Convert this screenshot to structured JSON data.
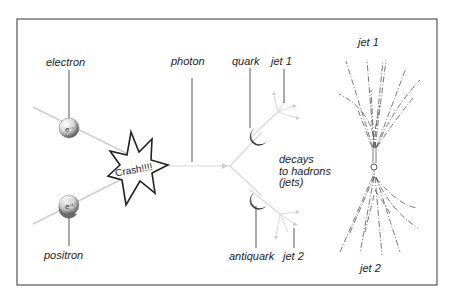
{
  "diagram": {
    "title": "",
    "frame": {
      "x": 17,
      "y": 19,
      "width": 420,
      "height": 266,
      "stroke": "#555555"
    },
    "labels": {
      "electron": "electron",
      "positron": "positron",
      "photon": "photon",
      "quark": "quark",
      "antiquark": "antiquark",
      "jet1_left": "jet 1",
      "jet2_left": "jet 2",
      "decays": "decays\nto hadrons\n(jets)",
      "jet1_right": "jet 1",
      "jet2_right": "jet 2",
      "crash": "Crash!!!!"
    },
    "particles": {
      "electron_symbol": "e⁻",
      "positron_symbol": "e⁺"
    },
    "colors": {
      "text": "#222222",
      "pointer": "#444444",
      "beam": "#cfcfcf",
      "star_stroke": "#222222",
      "track": "#555555"
    },
    "stages": [
      "electron-positron collision",
      "photon",
      "quark-antiquark pair",
      "hadron jets"
    ]
  }
}
